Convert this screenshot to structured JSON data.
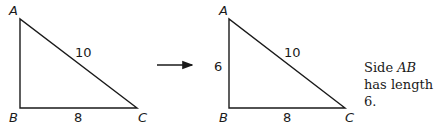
{
  "diagram": {
    "left_triangle": {
      "vertices": {
        "A": "A",
        "B": "B",
        "C": "C"
      },
      "side_labels": {
        "AC": "10",
        "BC": "8"
      }
    },
    "arrow": {
      "icon": "right-arrow-icon"
    },
    "right_triangle": {
      "vertices": {
        "A": "A",
        "B": "B",
        "C": "C"
      },
      "side_labels": {
        "AB": "6",
        "AC": "10",
        "BC": "8"
      }
    },
    "caption": {
      "prefix": "Side ",
      "segment": "AB",
      "suffix": " has length 6."
    },
    "colors": {
      "stroke": "#1a1a1a",
      "background": "#ffffff"
    }
  }
}
